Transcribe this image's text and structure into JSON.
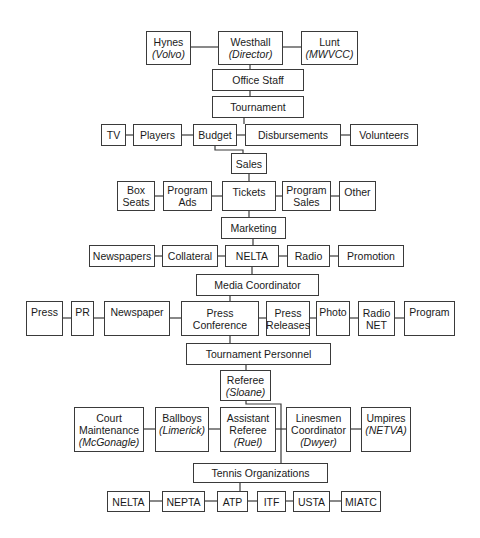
{
  "colors": {
    "line": "#3a3a3a",
    "box_border": "#3a3a3a",
    "text": "#1a1a1a",
    "background": "#ffffff"
  },
  "nodes": [
    {
      "id": "hynes",
      "lines": [
        "Hynes"
      ],
      "sub": "(Volvo)",
      "x": 146,
      "y": 31,
      "w": 45,
      "h": 34
    },
    {
      "id": "westhall",
      "lines": [
        "Westhall"
      ],
      "sub": "(Director)",
      "x": 218,
      "y": 31,
      "w": 65,
      "h": 34
    },
    {
      "id": "lunt",
      "lines": [
        "Lunt"
      ],
      "sub": "(MWVCC)",
      "x": 301,
      "y": 31,
      "w": 57,
      "h": 34
    },
    {
      "id": "office-staff",
      "lines": [
        "Office Staff"
      ],
      "x": 212,
      "y": 69,
      "w": 92,
      "h": 22
    },
    {
      "id": "tournament",
      "lines": [
        "Tournament"
      ],
      "x": 212,
      "y": 96,
      "w": 92,
      "h": 22
    },
    {
      "id": "tv",
      "lines": [
        "TV"
      ],
      "x": 101,
      "y": 124,
      "w": 25,
      "h": 22
    },
    {
      "id": "players",
      "lines": [
        "Players"
      ],
      "x": 133,
      "y": 124,
      "w": 49,
      "h": 22
    },
    {
      "id": "budget",
      "lines": [
        "Budget"
      ],
      "x": 193,
      "y": 124,
      "w": 44,
      "h": 22
    },
    {
      "id": "disbursements",
      "lines": [
        "Disbursements"
      ],
      "x": 245,
      "y": 124,
      "w": 96,
      "h": 22
    },
    {
      "id": "volunteers",
      "lines": [
        "Volunteers"
      ],
      "x": 350,
      "y": 124,
      "w": 68,
      "h": 22
    },
    {
      "id": "sales",
      "lines": [
        "Sales"
      ],
      "x": 231,
      "y": 153,
      "w": 36,
      "h": 21
    },
    {
      "id": "box-seats",
      "lines": [
        "Box",
        "Seats"
      ],
      "x": 117,
      "y": 181,
      "w": 38,
      "h": 30
    },
    {
      "id": "program-ads",
      "lines": [
        "Program",
        "Ads"
      ],
      "x": 163,
      "y": 181,
      "w": 49,
      "h": 30
    },
    {
      "id": "tickets",
      "lines": [
        "Tickets"
      ],
      "x": 222,
      "y": 181,
      "w": 54,
      "h": 30,
      "top": true
    },
    {
      "id": "program-sales",
      "lines": [
        "Program",
        "Sales"
      ],
      "x": 282,
      "y": 181,
      "w": 49,
      "h": 30
    },
    {
      "id": "other",
      "lines": [
        "Other"
      ],
      "x": 339,
      "y": 181,
      "w": 37,
      "h": 30,
      "top": true
    },
    {
      "id": "marketing",
      "lines": [
        "Marketing"
      ],
      "x": 221,
      "y": 217,
      "w": 65,
      "h": 22
    },
    {
      "id": "newspapers",
      "lines": [
        "Newspapers"
      ],
      "x": 89,
      "y": 245,
      "w": 66,
      "h": 22
    },
    {
      "id": "collateral",
      "lines": [
        "Collateral"
      ],
      "x": 162,
      "y": 245,
      "w": 56,
      "h": 22
    },
    {
      "id": "nelta-mkt",
      "lines": [
        "NELTA"
      ],
      "x": 225,
      "y": 245,
      "w": 54,
      "h": 22
    },
    {
      "id": "radio",
      "lines": [
        "Radio"
      ],
      "x": 287,
      "y": 245,
      "w": 43,
      "h": 22
    },
    {
      "id": "promotion",
      "lines": [
        "Promotion"
      ],
      "x": 338,
      "y": 245,
      "w": 66,
      "h": 22
    },
    {
      "id": "media-coordinator",
      "lines": [
        "Media Coordinator"
      ],
      "x": 196,
      "y": 274,
      "w": 123,
      "h": 22
    },
    {
      "id": "press",
      "lines": [
        "Press"
      ],
      "x": 26,
      "y": 301,
      "w": 37,
      "h": 35,
      "top": true
    },
    {
      "id": "pr",
      "lines": [
        "PR"
      ],
      "x": 71,
      "y": 301,
      "w": 23,
      "h": 35,
      "top": true
    },
    {
      "id": "newspaper",
      "lines": [
        "Newspaper"
      ],
      "x": 104,
      "y": 301,
      "w": 66,
      "h": 35,
      "top": true
    },
    {
      "id": "press-conference",
      "lines": [
        "Press",
        "Conference"
      ],
      "x": 181,
      "y": 301,
      "w": 78,
      "h": 35
    },
    {
      "id": "press-releases",
      "lines": [
        "Press",
        "Releases"
      ],
      "x": 266,
      "y": 301,
      "w": 44,
      "h": 35
    },
    {
      "id": "photo",
      "lines": [
        "Photo"
      ],
      "x": 316,
      "y": 301,
      "w": 34,
      "h": 35,
      "top": true
    },
    {
      "id": "radio-net",
      "lines": [
        "Radio",
        "NET"
      ],
      "x": 358,
      "y": 301,
      "w": 37,
      "h": 35
    },
    {
      "id": "program",
      "lines": [
        "Program"
      ],
      "x": 404,
      "y": 301,
      "w": 51,
      "h": 35,
      "top": true
    },
    {
      "id": "tournament-personnel",
      "lines": [
        "Tournament Personnel"
      ],
      "x": 186,
      "y": 343,
      "w": 145,
      "h": 22
    },
    {
      "id": "referee",
      "lines": [
        "Referee"
      ],
      "sub": "(Sloane)",
      "x": 220,
      "y": 370,
      "w": 51,
      "h": 31
    },
    {
      "id": "court-maintenance",
      "lines": [
        "Court",
        "Maintenance"
      ],
      "sub": "(McGonagle)",
      "x": 74,
      "y": 407,
      "w": 70,
      "h": 45
    },
    {
      "id": "ballboys",
      "lines": [
        "Ballboys"
      ],
      "sub": "(Limerick)",
      "x": 155,
      "y": 407,
      "w": 54,
      "h": 45,
      "top": true
    },
    {
      "id": "assistant-referee",
      "lines": [
        "Assistant",
        "Referee"
      ],
      "sub": "(Ruel)",
      "x": 220,
      "y": 407,
      "w": 56,
      "h": 45
    },
    {
      "id": "linesmen-coordinator",
      "lines": [
        "Linesmen",
        "Coordinator"
      ],
      "sub": "(Dwyer)",
      "x": 286,
      "y": 407,
      "w": 65,
      "h": 45
    },
    {
      "id": "umpires",
      "lines": [
        "Umpires"
      ],
      "sub": "(NETVA)",
      "x": 361,
      "y": 407,
      "w": 50,
      "h": 45,
      "top": true
    },
    {
      "id": "tennis-organizations",
      "lines": [
        "Tennis Organizations"
      ],
      "x": 193,
      "y": 463,
      "w": 135,
      "h": 20
    },
    {
      "id": "nelta-org",
      "lines": [
        "NELTA"
      ],
      "x": 107,
      "y": 491,
      "w": 43,
      "h": 21
    },
    {
      "id": "nepta",
      "lines": [
        "NEPTA"
      ],
      "x": 162,
      "y": 491,
      "w": 43,
      "h": 21
    },
    {
      "id": "atp",
      "lines": [
        "ATP"
      ],
      "x": 217,
      "y": 491,
      "w": 31,
      "h": 21
    },
    {
      "id": "itf",
      "lines": [
        "ITF"
      ],
      "x": 257,
      "y": 491,
      "w": 29,
      "h": 21
    },
    {
      "id": "usta",
      "lines": [
        "USTA"
      ],
      "x": 293,
      "y": 491,
      "w": 37,
      "h": 21
    },
    {
      "id": "miatc",
      "lines": [
        "MIATC"
      ],
      "x": 341,
      "y": 491,
      "w": 40,
      "h": 21
    }
  ],
  "edges": [
    [
      [
        191,
        47
      ],
      [
        218,
        47
      ]
    ],
    [
      [
        283,
        47
      ],
      [
        301,
        47
      ]
    ],
    [
      [
        250,
        65
      ],
      [
        250,
        69
      ]
    ],
    [
      [
        250,
        91
      ],
      [
        250,
        96
      ]
    ],
    [
      [
        244,
        118
      ],
      [
        244,
        124
      ]
    ],
    [
      [
        126,
        135
      ],
      [
        133,
        135
      ]
    ],
    [
      [
        182,
        135
      ],
      [
        193,
        135
      ]
    ],
    [
      [
        237,
        135
      ],
      [
        245,
        135
      ]
    ],
    [
      [
        341,
        135
      ],
      [
        350,
        135
      ]
    ],
    [
      [
        215,
        146
      ],
      [
        215,
        150
      ],
      [
        243,
        150
      ],
      [
        243,
        153
      ]
    ],
    [
      [
        249,
        174
      ],
      [
        249,
        181
      ]
    ],
    [
      [
        155,
        196
      ],
      [
        163,
        196
      ]
    ],
    [
      [
        212,
        196
      ],
      [
        222,
        196
      ]
    ],
    [
      [
        276,
        196
      ],
      [
        282,
        196
      ]
    ],
    [
      [
        331,
        196
      ],
      [
        339,
        196
      ]
    ],
    [
      [
        249,
        211
      ],
      [
        249,
        217
      ]
    ],
    [
      [
        253,
        239
      ],
      [
        253,
        245
      ]
    ],
    [
      [
        155,
        256
      ],
      [
        162,
        256
      ]
    ],
    [
      [
        218,
        256
      ],
      [
        225,
        256
      ]
    ],
    [
      [
        279,
        256
      ],
      [
        287,
        256
      ]
    ],
    [
      [
        330,
        256
      ],
      [
        338,
        256
      ]
    ],
    [
      [
        252,
        267
      ],
      [
        252,
        274
      ]
    ],
    [
      [
        230,
        296
      ],
      [
        230,
        301
      ]
    ],
    [
      [
        63,
        318
      ],
      [
        71,
        318
      ]
    ],
    [
      [
        94,
        318
      ],
      [
        104,
        318
      ]
    ],
    [
      [
        170,
        318
      ],
      [
        181,
        318
      ]
    ],
    [
      [
        259,
        318
      ],
      [
        266,
        318
      ]
    ],
    [
      [
        310,
        318
      ],
      [
        316,
        318
      ]
    ],
    [
      [
        350,
        318
      ],
      [
        358,
        318
      ]
    ],
    [
      [
        395,
        318
      ],
      [
        404,
        318
      ]
    ],
    [
      [
        230,
        336
      ],
      [
        230,
        343
      ]
    ],
    [
      [
        246,
        365
      ],
      [
        246,
        370
      ]
    ],
    [
      [
        246,
        401
      ],
      [
        246,
        404
      ],
      [
        281,
        404
      ],
      [
        281,
        463
      ]
    ],
    [
      [
        144,
        429
      ],
      [
        155,
        429
      ]
    ],
    [
      [
        209,
        429
      ],
      [
        220,
        429
      ]
    ],
    [
      [
        276,
        429
      ],
      [
        286,
        429
      ]
    ],
    [
      [
        351,
        429
      ],
      [
        361,
        429
      ]
    ],
    [
      [
        240,
        483
      ],
      [
        240,
        491
      ]
    ],
    [
      [
        150,
        501
      ],
      [
        162,
        501
      ]
    ],
    [
      [
        205,
        501
      ],
      [
        217,
        501
      ]
    ],
    [
      [
        248,
        501
      ],
      [
        257,
        501
      ]
    ],
    [
      [
        286,
        501
      ],
      [
        293,
        501
      ]
    ],
    [
      [
        330,
        501
      ],
      [
        341,
        501
      ]
    ]
  ]
}
